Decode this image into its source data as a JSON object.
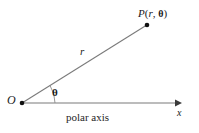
{
  "figure": {
    "type": "polar-coordinate-diagram",
    "width": 199,
    "height": 133,
    "background_color": "#ffffff",
    "line_color": "#7a7a7a",
    "text_color": "#1a1a1a"
  },
  "labels": {
    "point_P": {
      "point_name": "P",
      "open_paren": "(",
      "radius_symbol": "r",
      "comma": ", ",
      "angle_symbol": "θ",
      "close_paren": ")",
      "full_text": "P(r, θ)"
    },
    "radius": "r",
    "origin": "O",
    "angle": "θ",
    "axis_variable": "x",
    "axis_caption": "polar axis"
  },
  "geometry": {
    "origin_point": {
      "x": 22,
      "y": 103
    },
    "terminal_point": {
      "x": 147,
      "y": 25
    },
    "axis_arrow_tip": {
      "x": 182,
      "y": 103
    },
    "angle_arc_radius": 33,
    "dot_radius": 2.2
  }
}
